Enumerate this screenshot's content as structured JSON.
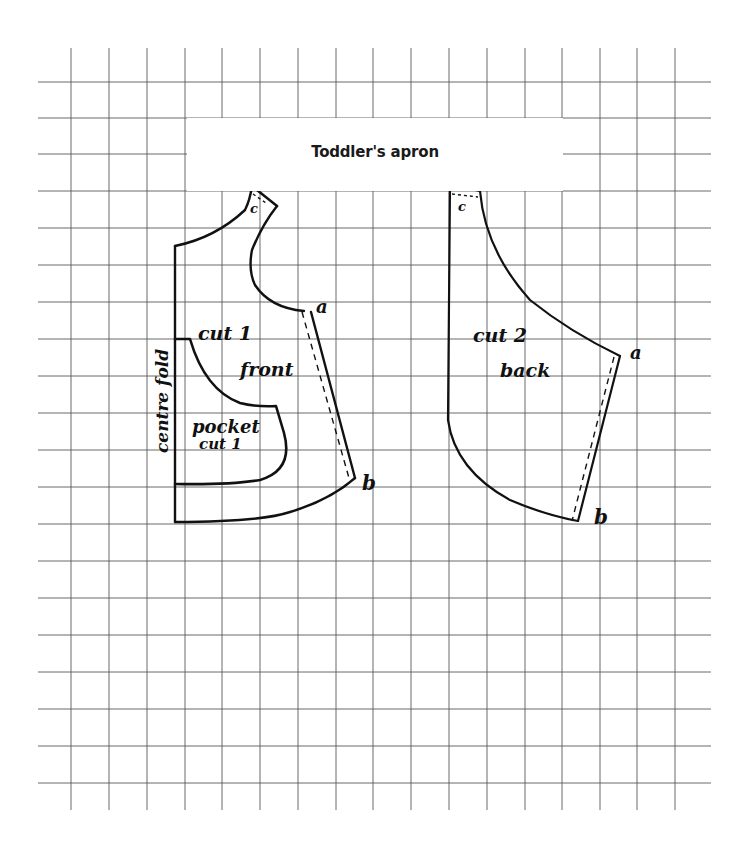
{
  "title": "Toddler's apron",
  "grid": {
    "color": "#555555",
    "columns_x": [
      71,
      109,
      147,
      185,
      222,
      260,
      298,
      336,
      373,
      411,
      449,
      487,
      525,
      562,
      600,
      637,
      675
    ],
    "rows_y": [
      82,
      118,
      154,
      191,
      228,
      265,
      302,
      339,
      376,
      413,
      450,
      487,
      524,
      561,
      598,
      635,
      672,
      709,
      746,
      783
    ],
    "top": 48,
    "bottom": 810,
    "left": 38,
    "right": 711
  },
  "pieces": {
    "front": {
      "label_cut": "cut 1",
      "label_name": "front",
      "label_fold": "centre fold",
      "pocket_label": "pocket",
      "pocket_cut": "cut 1",
      "points": {
        "a": "a",
        "b": "b",
        "c": "c"
      }
    },
    "back": {
      "label_cut": "cut 2",
      "label_name": "back",
      "points": {
        "a": "a",
        "b": "b",
        "c": "c"
      }
    }
  },
  "colors": {
    "ink": "#111111",
    "paper": "#ffffff"
  }
}
